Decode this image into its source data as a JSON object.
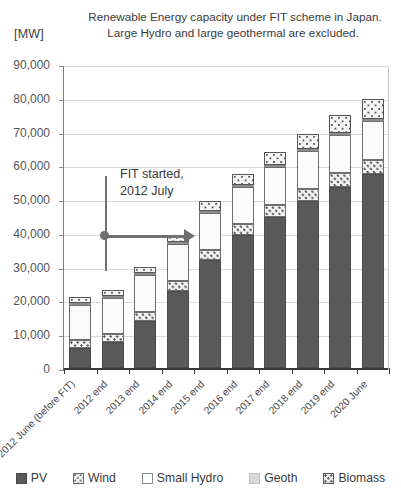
{
  "chart_data": {
    "type": "bar",
    "subtype": "stacked-column",
    "title": "Renewable Energy capacity under FIT scheme  in Japan. Large Hydro and large geothermal are excluded.",
    "title_lines": [
      "Renewable Energy capacity under FIT scheme  in Japan.",
      "Large Hydro and large geothermal are excluded."
    ],
    "unit_label": "[MW]",
    "xlabel": "",
    "ylabel": "[MW]",
    "ylim": [
      0,
      90000
    ],
    "ytick_step": 10000,
    "ytick_labels": [
      "90,000",
      "80,000",
      "70,000",
      "60,000",
      "50,000",
      "40,000",
      "30,000",
      "20,000",
      "10,000",
      "0"
    ],
    "ytick_values": [
      90000,
      80000,
      70000,
      60000,
      50000,
      40000,
      30000,
      20000,
      10000,
      0
    ],
    "grid": true,
    "legend_position": "bottom",
    "categories": [
      "2012 June (before FIT)",
      "2012 end",
      "2013 end",
      "2014 end",
      "2015 end",
      "2016 end",
      "2017 end",
      "2018 end",
      "2019 end",
      "2020 June"
    ],
    "series": [
      {
        "name": "PV",
        "color": "#595959",
        "pattern": "solid-dark",
        "values": [
          5800,
          7600,
          13900,
          22900,
          32000,
          39300,
          44800,
          49300,
          53700,
          57400
        ]
      },
      {
        "name": "Wind",
        "color": "#f2f2f2",
        "pattern": "dotted",
        "values": [
          2600,
          2600,
          2700,
          2800,
          3000,
          3200,
          3400,
          3600,
          3900,
          4200
        ]
      },
      {
        "name": "Small Hydro",
        "color": "#fbfbfb",
        "pattern": "white",
        "values": [
          10400,
          10600,
          10800,
          10900,
          11000,
          11100,
          11200,
          11300,
          11400,
          11500
        ]
      },
      {
        "name": "Geoth",
        "color": "#d4d4d4",
        "pattern": "light-gray",
        "values": [
          200,
          200,
          200,
          200,
          250,
          280,
          300,
          350,
          400,
          450
        ]
      },
      {
        "name": "Biomass",
        "color": "#f4f4f4",
        "pattern": "checkered",
        "values": [
          1700,
          1800,
          1900,
          2300,
          2800,
          3300,
          3900,
          4500,
          5200,
          6100
        ]
      }
    ],
    "totals": [
      20700,
      22800,
      29500,
      39100,
      49050,
      57180,
      63600,
      69050,
      74600,
      79650
    ],
    "annotations": [
      {
        "name": "fit-started",
        "text_lines": [
          "FIT started,",
          "2012 July"
        ],
        "marker": "vertical-line-with-right-arrow"
      }
    ]
  },
  "legend": {
    "items": [
      {
        "label": "PV",
        "swatch": "pv-swatch"
      },
      {
        "label": "Wind",
        "swatch": "wind-swatch"
      },
      {
        "label": "Small Hydro",
        "swatch": "small-hydro-swatch"
      },
      {
        "label": "Geoth",
        "swatch": "geoth-swatch"
      },
      {
        "label": "Biomass",
        "swatch": "biomass-swatch"
      }
    ]
  }
}
